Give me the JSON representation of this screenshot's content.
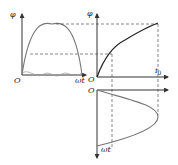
{
  "diagram": {
    "type": "magnetization-projection",
    "panels": [
      {
        "id": "flux-vs-time",
        "x_label": "ωt",
        "y_label": "φ",
        "origin_label": "O",
        "curve": "sinusoidal flux arch"
      },
      {
        "id": "flux-vs-current",
        "x_label": "i0",
        "y_label": "φ",
        "origin_label": "O",
        "curve": "saturating magnetization curve"
      },
      {
        "id": "current-vs-time",
        "x_label": "ωt",
        "origin_label": "O",
        "curve": "peaked excitation current (rotated)"
      }
    ],
    "labels": {
      "phi_left": "φ",
      "origin_left": "O",
      "omega_t_left": "ωt",
      "phi_mid": "φ",
      "origin_mid": "O",
      "i0": "i",
      "i0_sub": "0",
      "origin_bottom": "O",
      "omega_t_bottom": "ωt"
    },
    "colors": {
      "axis": "#333333",
      "sine_curve": "#777777",
      "magnetization_curve": "#222222",
      "dashed": "#555555"
    }
  }
}
